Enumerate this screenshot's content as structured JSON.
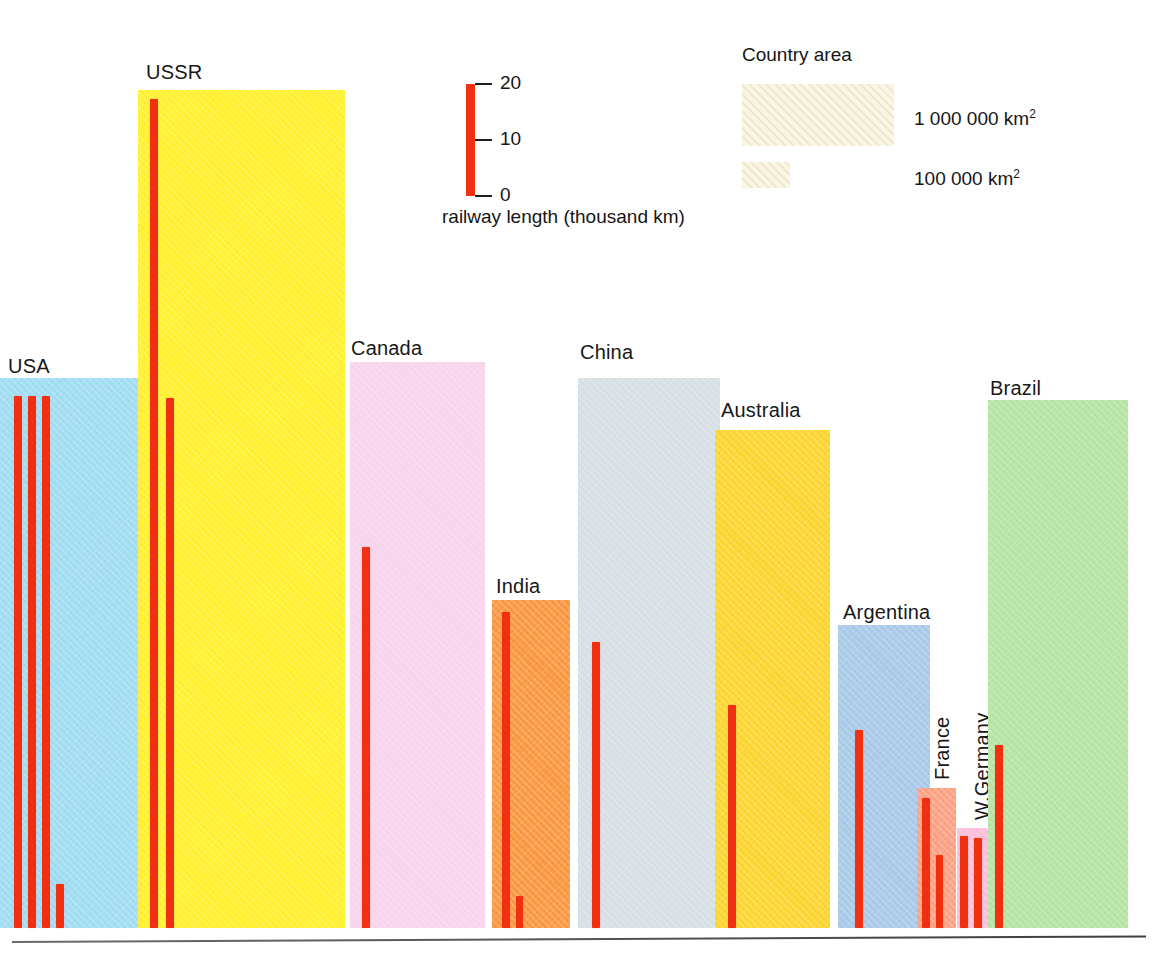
{
  "chart_data": {
    "type": "bar",
    "title": "",
    "xlabel": "",
    "ylabel": "railway length (thousand km)",
    "ylim": [
      0,
      20
    ],
    "yticks": [
      0,
      10,
      20
    ],
    "ytick_labels": [
      "0",
      "10",
      "20"
    ],
    "grid": false,
    "legend_position": "top-right",
    "categories": [
      "USA",
      "USSR",
      "Canada",
      "India",
      "China",
      "Australia",
      "Argentina",
      "France",
      "W.Germany",
      "Brazil"
    ],
    "series": [
      {
        "name": "railway length (thousand km)",
        "note": "each country shows one or more red bars; value list gives every bar left-to-right",
        "values": [
          [
            24.0,
            24.0,
            24.0,
            1.6
          ],
          [
            23.6,
            16.2
          ],
          [
            10.5,
            0.0
          ],
          [
            9.4,
            1.2
          ],
          [
            7.3
          ],
          [
            6.4
          ],
          [
            5.8
          ],
          [
            4.3,
            2.1
          ],
          [
            4.5,
            4.4
          ],
          [
            5.5
          ]
        ]
      }
    ],
    "area_series": {
      "name": "Country area",
      "unit": "km2",
      "values": [
        9363,
        22402,
        9976,
        3288,
        9597,
        7687,
        2767,
        547,
        249,
        8512
      ],
      "unit_note": "thousand km2; block height scales with area"
    }
  },
  "scale_key": {
    "caption": "railway length (thousand km)",
    "ticks": [
      {
        "label": "20",
        "value": 20
      },
      {
        "label": "10",
        "value": 10
      },
      {
        "label": "0",
        "value": 0
      }
    ],
    "bar_color": "#F03010"
  },
  "area_key": {
    "title": "Country area",
    "entries": [
      {
        "label": "1 000 000 km",
        "exponent": "2",
        "size": "large"
      },
      {
        "label": "100 000 km",
        "exponent": "2",
        "size": "small"
      }
    ]
  },
  "countries": [
    {
      "name": "USA",
      "label_orientation": "horizontal",
      "block_color": "#9FDCF2",
      "block": {
        "x": 0,
        "y": 378,
        "w": 138,
        "h": 550
      },
      "label": {
        "x": 8,
        "y": 356
      },
      "bars": [
        {
          "x": 14,
          "y": 396,
          "w": 8,
          "h": 532
        },
        {
          "x": 28,
          "y": 396,
          "w": 8,
          "h": 532
        },
        {
          "x": 42,
          "y": 396,
          "w": 8,
          "h": 532
        },
        {
          "x": 56,
          "y": 884,
          "w": 8,
          "h": 44
        }
      ]
    },
    {
      "name": "USSR",
      "label_orientation": "horizontal",
      "block_color": "#FFF02A",
      "block": {
        "x": 138,
        "y": 90,
        "w": 207,
        "h": 838
      },
      "label": {
        "x": 146,
        "y": 62
      },
      "bars": [
        {
          "x": 150,
          "y": 99,
          "w": 8,
          "h": 829
        },
        {
          "x": 166,
          "y": 398,
          "w": 8,
          "h": 530
        }
      ]
    },
    {
      "name": "Canada",
      "label_orientation": "horizontal",
      "block_color": "#F7D3EC",
      "block": {
        "x": 350,
        "y": 362,
        "w": 135,
        "h": 566
      },
      "label": {
        "x": 351,
        "y": 338
      },
      "bars": [
        {
          "x": 362,
          "y": 547,
          "w": 8,
          "h": 381
        }
      ]
    },
    {
      "name": "India",
      "label_orientation": "horizontal",
      "block_color": "#F9973F",
      "block": {
        "x": 492,
        "y": 600,
        "w": 78,
        "h": 328
      },
      "label": {
        "x": 496,
        "y": 576
      },
      "bars": [
        {
          "x": 502,
          "y": 612,
          "w": 8,
          "h": 316
        },
        {
          "x": 516,
          "y": 896,
          "w": 7,
          "h": 32
        }
      ]
    },
    {
      "name": "China",
      "label_orientation": "horizontal",
      "block_color": "#D6DFE4",
      "block": {
        "x": 578,
        "y": 378,
        "w": 142,
        "h": 550
      },
      "label": {
        "x": 580,
        "y": 342
      },
      "bars": [
        {
          "x": 592,
          "y": 642,
          "w": 8,
          "h": 286
        }
      ]
    },
    {
      "name": "Australia",
      "label_orientation": "horizontal",
      "block_color": "#FBD52E",
      "block": {
        "x": 715,
        "y": 430,
        "w": 115,
        "h": 498
      },
      "label": {
        "x": 721,
        "y": 400
      },
      "bars": [
        {
          "x": 728,
          "y": 705,
          "w": 8,
          "h": 223
        }
      ]
    },
    {
      "name": "Argentina",
      "label_orientation": "horizontal",
      "block_color": "#A8C8E8",
      "block": {
        "x": 838,
        "y": 625,
        "w": 92,
        "h": 303
      },
      "label": {
        "x": 843,
        "y": 602
      },
      "bars": [
        {
          "x": 855,
          "y": 730,
          "w": 8,
          "h": 198
        }
      ]
    },
    {
      "name": "France",
      "label_orientation": "vertical",
      "block_color": "#FBA082",
      "block": {
        "x": 917,
        "y": 788,
        "w": 39,
        "h": 140
      },
      "label": {
        "x": 932,
        "y": 780
      },
      "bars": [
        {
          "x": 922,
          "y": 798,
          "w": 8,
          "h": 130
        },
        {
          "x": 936,
          "y": 855,
          "w": 7,
          "h": 73
        }
      ]
    },
    {
      "name": "W.Germany",
      "label_orientation": "vertical",
      "block_color": "#FBBDD8",
      "block": {
        "x": 957,
        "y": 828,
        "w": 33,
        "h": 100
      },
      "label": {
        "x": 972,
        "y": 820
      },
      "bars": [
        {
          "x": 960,
          "y": 836,
          "w": 8,
          "h": 92
        },
        {
          "x": 974,
          "y": 838,
          "w": 8,
          "h": 90
        }
      ]
    },
    {
      "name": "Brazil",
      "label_orientation": "horizontal",
      "block_color": "#B5E3A2",
      "block": {
        "x": 988,
        "y": 400,
        "w": 140,
        "h": 528
      },
      "label": {
        "x": 990,
        "y": 378
      },
      "bars": [
        {
          "x": 995,
          "y": 745,
          "w": 8,
          "h": 183
        }
      ]
    }
  ]
}
